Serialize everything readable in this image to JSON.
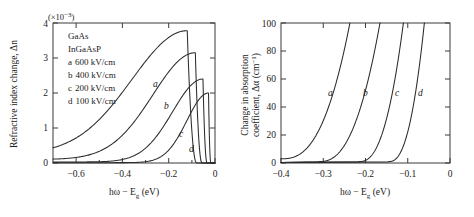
{
  "figure": {
    "title": "",
    "background": "#ffffff",
    "curve_color": "#2b2b2b",
    "axis_color": "#3a3a3a"
  },
  "chart_data": [
    {
      "type": "line",
      "panel": "left",
      "title": "",
      "xlabel": "ħω − E_g (eV)",
      "xlabel_parts": {
        "pre": "hω − E",
        "sub": "g",
        "post": " (eV)"
      },
      "ylabel": "Refractive index change, Δn",
      "multiplier": "(×10⁻³)",
      "multiplier_parts": {
        "base": "(×10",
        "sup": "−3",
        "close": ")"
      },
      "xlim": [
        -0.7,
        0.0
      ],
      "ylim": [
        0,
        4
      ],
      "xticks": [
        -0.6,
        -0.4,
        -0.2,
        0
      ],
      "xticklabels": [
        "−0.6",
        "−0.4",
        "−0.2",
        "0"
      ],
      "yticks": [
        0,
        1,
        2,
        3,
        4
      ],
      "yticklabels": [
        "0",
        "1",
        "2",
        "3",
        "4"
      ],
      "grid": false,
      "legend_position": "upper-left-inside",
      "annotations": [
        {
          "text": "a",
          "x": -0.33,
          "y": 2.25
        },
        {
          "text": "b",
          "x": -0.255,
          "y": 1.63
        },
        {
          "text": "c",
          "x": -0.155,
          "y": 0.82
        },
        {
          "text": "d",
          "x": -0.1,
          "y": 0.36
        }
      ],
      "series": [
        {
          "name": "a",
          "field": "600 kV/cm",
          "peak_x": -0.12,
          "peak_y": 3.78,
          "baseline_y": 0.25
        },
        {
          "name": "b",
          "field": "400 kV/cm",
          "peak_x": -0.085,
          "peak_y": 3.15,
          "baseline_y": 0.1
        },
        {
          "name": "c",
          "field": "200 kV/cm",
          "peak_x": -0.052,
          "peak_y": 2.4,
          "baseline_y": 0.03
        },
        {
          "name": "d",
          "field": "100 kV/cm",
          "peak_x": -0.028,
          "peak_y": 2.0,
          "baseline_y": 0.01
        }
      ]
    },
    {
      "type": "line",
      "panel": "right",
      "title": "",
      "xlabel": "ħω − E_g (eV)",
      "xlabel_parts": {
        "pre": "hω − E",
        "sub": "g",
        "post": " (eV)"
      },
      "ylabel": "Change in absorption coefficient, Δα (cm⁻¹)",
      "ylabel_line1": "Change in absorption",
      "ylabel_line2_parts": {
        "pre": "coefficient, Δα (cm",
        "sup": "−1",
        "post": ")"
      },
      "xlim": [
        -0.4,
        0.0
      ],
      "ylim": [
        0,
        100
      ],
      "xticks": [
        -0.4,
        -0.3,
        -0.2,
        -0.1,
        0
      ],
      "xticklabels": [
        "−0.4",
        "−0.3",
        "−0.2",
        "−0.1",
        "0"
      ],
      "yticks": [
        0,
        20,
        40,
        60,
        80,
        100
      ],
      "yticklabels": [
        "0",
        "20",
        "40",
        "60",
        "80",
        "100"
      ],
      "grid": false,
      "legend_position": "none",
      "annotations": [
        {
          "text": "a",
          "x": -0.268,
          "y": 55
        },
        {
          "text": "b",
          "x": -0.198,
          "y": 55
        },
        {
          "text": "c",
          "x": -0.133,
          "y": 55
        },
        {
          "text": "d",
          "x": -0.086,
          "y": 55
        }
      ],
      "series": [
        {
          "name": "a",
          "field": "600 kV/cm",
          "onset_x": -0.4,
          "rise_x": -0.235
        },
        {
          "name": "b",
          "field": "400 kV/cm",
          "onset_x": -0.31,
          "rise_x": -0.168
        },
        {
          "name": "c",
          "field": "200 kV/cm",
          "onset_x": -0.215,
          "rise_x": -0.112
        },
        {
          "name": "d",
          "field": "100 kV/cm",
          "onset_x": -0.145,
          "rise_x": -0.062
        }
      ]
    }
  ],
  "legend": {
    "material_1": "GaAs",
    "material_2": "InGaAsP",
    "entries": [
      {
        "key": "a",
        "value": "600 kV/cm"
      },
      {
        "key": "b",
        "value": "400 kV/cm"
      },
      {
        "key": "c",
        "value": "200 kV/cm"
      },
      {
        "key": "d",
        "value": "100 kV/cm"
      }
    ]
  }
}
